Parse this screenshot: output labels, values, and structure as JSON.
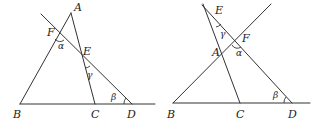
{
  "figures": [
    {
      "id": "left",
      "labels": {
        "A": "A",
        "B": "B",
        "C": "C",
        "D": "D",
        "E": "E",
        "F": "F",
        "alpha": "α",
        "beta": "β",
        "gamma": "γ"
      }
    },
    {
      "id": "right",
      "labels": {
        "A": "A",
        "B": "B",
        "C": "C",
        "D": "D",
        "E": "E",
        "F": "F",
        "alpha": "α",
        "beta": "β",
        "gamma": "γ"
      }
    }
  ],
  "colors": {
    "line": "#333333",
    "text": "#222222",
    "background": "#ffffff"
  }
}
